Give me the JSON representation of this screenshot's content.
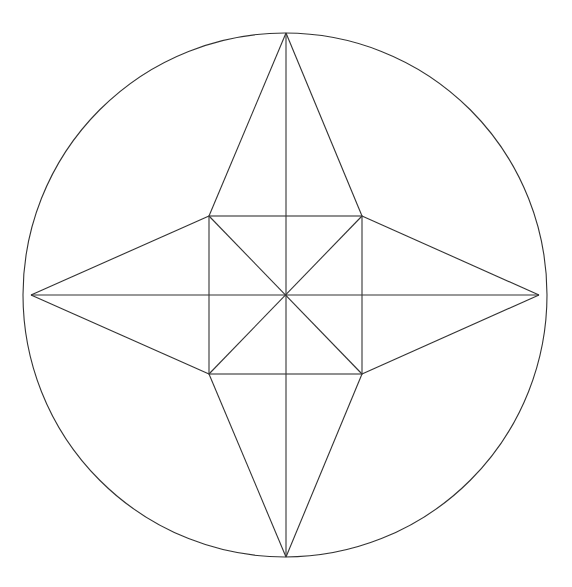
{
  "diagram": {
    "title": "",
    "stroke_color": "#333333",
    "background": "#ffffff",
    "circle": {
      "cx": 285,
      "cy": 295,
      "r": 262
    },
    "outer_points": {
      "top": [
        286,
        33
      ],
      "right": [
        539,
        295
      ],
      "bottom": [
        286,
        557
      ],
      "left": [
        31,
        295
      ]
    },
    "square": {
      "top_left": [
        209,
        216
      ],
      "top_right": [
        362,
        216
      ],
      "bottom_right": [
        362,
        374
      ],
      "bottom_left": [
        209,
        374
      ]
    },
    "center": [
      286,
      295
    ]
  }
}
